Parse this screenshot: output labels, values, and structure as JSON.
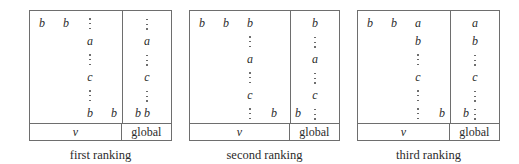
{
  "figure": {
    "type": "diagram",
    "dots_glyph": "vertical-ellipsis",
    "panels": [
      {
        "caption": "first ranking",
        "footer": {
          "left": "v",
          "right": "global"
        },
        "left_rows": [
          [
            "b",
            "b",
            "dots",
            "",
            ""
          ],
          [
            "",
            "",
            "a",
            "",
            ""
          ],
          [
            "",
            "",
            "dots",
            "",
            ""
          ],
          [
            "",
            "",
            "c",
            "",
            ""
          ],
          [
            "",
            "",
            "dots",
            "",
            ""
          ],
          [
            "",
            "",
            "b",
            "b",
            "b"
          ]
        ],
        "right_rows": [
          "dots",
          "a",
          "dots",
          "c",
          "dots",
          "b"
        ]
      },
      {
        "caption": "second ranking",
        "footer": {
          "left": "v",
          "right": "global"
        },
        "left_rows": [
          [
            "b",
            "b",
            "b",
            "",
            ""
          ],
          [
            "",
            "",
            "dots",
            "",
            ""
          ],
          [
            "",
            "",
            "a",
            "",
            ""
          ],
          [
            "",
            "",
            "dots",
            "",
            ""
          ],
          [
            "",
            "",
            "c",
            "",
            ""
          ],
          [
            "",
            "",
            "dots",
            "b",
            "b"
          ]
        ],
        "right_rows": [
          "b",
          "dots",
          "a",
          "dots",
          "c",
          "dots"
        ]
      },
      {
        "caption": "third ranking",
        "footer": {
          "left": "v",
          "right": "global"
        },
        "left_rows": [
          [
            "b",
            "b",
            "a",
            "",
            ""
          ],
          [
            "",
            "",
            "b",
            "",
            ""
          ],
          [
            "",
            "",
            "dots",
            "",
            ""
          ],
          [
            "",
            "",
            "c",
            "",
            ""
          ],
          [
            "",
            "",
            "dots",
            "",
            ""
          ],
          [
            "",
            "",
            "dots",
            "b",
            "b"
          ]
        ],
        "right_rows": [
          "a",
          "b",
          "dots",
          "c",
          "dots",
          "dots"
        ]
      }
    ]
  },
  "colors": {
    "border": "#6e6e6e",
    "text": "#2b2b2b",
    "background": "#ffffff"
  }
}
